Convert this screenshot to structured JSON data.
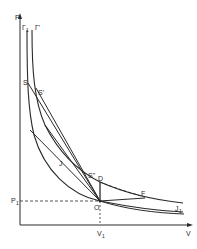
{
  "diagram": {
    "type": "P-V shock adiabat diagram",
    "axes": {
      "y_label": "P",
      "x_label": "V",
      "y_tick_label": "P",
      "y_tick_sub": "1",
      "x_tick_label": "V",
      "x_tick_sub": "1"
    },
    "labels": {
      "gamma1": "Γ",
      "gamma1_sub": "1",
      "gamma": "Γ'",
      "S": "S",
      "S_prime": "S'",
      "J": "J",
      "S_double_prime": "S\"",
      "D": "D",
      "O": "O",
      "F": "F",
      "J1": "J",
      "J1_sub": "1"
    },
    "colors": {
      "line": "#2a2a2a",
      "background": "#ffffff"
    }
  }
}
